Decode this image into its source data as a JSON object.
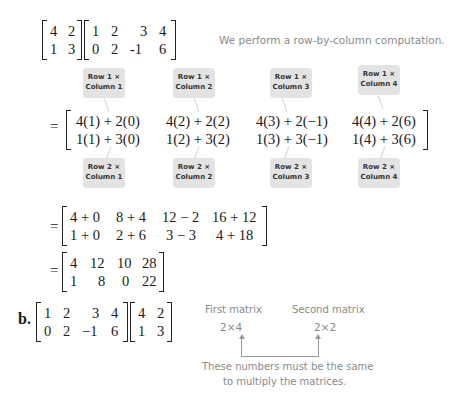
{
  "problem_a": {
    "left_matrix": [
      [
        "4",
        "2"
      ],
      [
        "1",
        "3"
      ]
    ],
    "right_matrix": [
      [
        "1",
        "2",
        "3",
        "4"
      ],
      [
        "0",
        "2",
        "-1",
        "6"
      ]
    ],
    "note": "We perform a row-by-column computation.",
    "callouts_top": [
      {
        "line1": "Row 1 ×",
        "line2": "Column 1"
      },
      {
        "line1": "Row 1 ×",
        "line2": "Column 2"
      },
      {
        "line1": "Row 1 ×",
        "line2": "Column 3"
      },
      {
        "line1": "Row 1 ×",
        "line2": "Column 4"
      }
    ],
    "step1": [
      [
        "4(1) + 2(0)",
        "4(2) + 2(2)",
        "4(3) + 2(−1)",
        "4(4) + 2(6)"
      ],
      [
        "1(1) + 3(0)",
        "1(2) + 3(2)",
        "1(3) + 3(−1)",
        "1(4) + 3(6)"
      ]
    ],
    "callouts_bottom": [
      {
        "line1": "Row 2 ×",
        "line2": "Column 1"
      },
      {
        "line1": "Row 2 ×",
        "line2": "Column 2"
      },
      {
        "line1": "Row 2 ×",
        "line2": "Column 3"
      },
      {
        "line1": "Row 2 ×",
        "line2": "Column 4"
      }
    ],
    "step2": [
      [
        "4 + 0",
        "8 + 4",
        "12 − 2",
        "16 + 12"
      ],
      [
        "1 + 0",
        "2 + 6",
        "3 − 3",
        "4 + 18"
      ]
    ],
    "result": [
      [
        "4",
        "12",
        "10",
        "28"
      ],
      [
        "1",
        "8",
        "0",
        "22"
      ]
    ],
    "equals": "="
  },
  "problem_b": {
    "label": "b.",
    "left_matrix": [
      [
        "1",
        "2",
        "3",
        "4"
      ],
      [
        "0",
        "2",
        "−1",
        "6"
      ]
    ],
    "right_matrix": [
      [
        "4",
        "2"
      ],
      [
        "1",
        "3"
      ]
    ],
    "first_label": "First matrix",
    "first_dims": "2×4",
    "second_label": "Second matrix",
    "second_dims": "2×2",
    "note_line1": "These numbers must be the same",
    "note_line2": "to multiply the matrices."
  }
}
